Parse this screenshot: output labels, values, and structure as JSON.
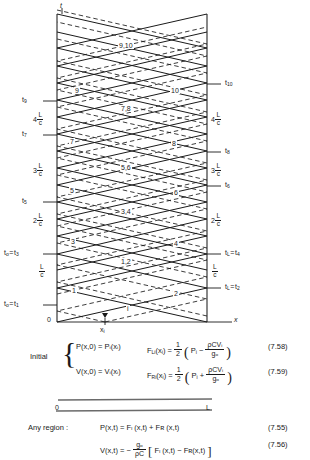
{
  "diagram": {
    "type": "x-t characteristics lattice diagram",
    "axis_t_label": "t",
    "axis_x_label": "x",
    "origin_label": "0",
    "xi_label": "x",
    "xi_sub": "i",
    "left_axis_x": 57,
    "right_axis_x": 207,
    "baseline_y": 322,
    "top_y": 14,
    "xi_x": 105,
    "left_ticks": [
      {
        "text": "t",
        "sub": "9",
        "y": 101,
        "kind": "t"
      },
      {
        "text": "4",
        "frac": [
          "L",
          "c"
        ],
        "y": 118,
        "kind": "frac"
      },
      {
        "text": "t",
        "sub": "7",
        "y": 135,
        "kind": "t"
      },
      {
        "text": "3",
        "frac": [
          "L",
          "c"
        ],
        "y": 169,
        "kind": "frac"
      },
      {
        "text": "t",
        "sub": "5",
        "y": 202,
        "kind": "t"
      },
      {
        "text": "2",
        "frac": [
          "L",
          "c"
        ],
        "y": 219,
        "kind": "frac"
      },
      {
        "text": "tₒ = t",
        "sub": "3",
        "y": 254,
        "kind": "t"
      },
      {
        "text": "",
        "frac": [
          "L",
          "c"
        ],
        "y": 270,
        "kind": "frac"
      },
      {
        "text": "tₒ = t",
        "sub": "1",
        "y": 305,
        "kind": "t"
      }
    ],
    "right_ticks": [
      {
        "text": "t",
        "sub": "10",
        "y": 84,
        "kind": "t"
      },
      {
        "text": "4",
        "frac": [
          "L",
          "c"
        ],
        "y": 118,
        "kind": "frac"
      },
      {
        "text": "t",
        "sub": "8",
        "y": 152,
        "kind": "t"
      },
      {
        "text": "3",
        "frac": [
          "L",
          "c"
        ],
        "y": 169,
        "kind": "frac"
      },
      {
        "text": "t",
        "sub": "6",
        "y": 186,
        "kind": "t"
      },
      {
        "text": "2",
        "frac": [
          "L",
          "c"
        ],
        "y": 219,
        "kind": "frac"
      },
      {
        "text": "tₗ = t",
        "sub": "4",
        "y": 254,
        "kind": "t"
      },
      {
        "text": "",
        "frac": [
          "L",
          "c"
        ],
        "y": 270,
        "kind": "frac"
      },
      {
        "text": "tₗ = t",
        "sub": "2",
        "y": 288,
        "kind": "t"
      }
    ],
    "wave_labels": [
      {
        "text": "9,10",
        "x": 124,
        "y": 47
      },
      {
        "text": "9",
        "x": 78,
        "y": 92
      },
      {
        "text": "10",
        "x": 175,
        "y": 92
      },
      {
        "text": "7,8",
        "x": 126,
        "y": 110
      },
      {
        "text": "7",
        "x": 73,
        "y": 143
      },
      {
        "text": "8",
        "x": 175,
        "y": 145
      },
      {
        "text": "5,6",
        "x": 126,
        "y": 169
      },
      {
        "text": "5",
        "x": 73,
        "y": 192
      },
      {
        "text": "6",
        "x": 177,
        "y": 194
      },
      {
        "text": "3,4",
        "x": 126,
        "y": 213
      },
      {
        "text": "3",
        "x": 74,
        "y": 243
      },
      {
        "text": "4",
        "x": 177,
        "y": 245
      },
      {
        "text": "1,2",
        "x": 126,
        "y": 263
      },
      {
        "text": "1",
        "x": 75,
        "y": 292
      },
      {
        "text": "2",
        "x": 177,
        "y": 295
      },
      {
        "text": "i",
        "x": 128,
        "y": 310
      }
    ]
  },
  "initial": {
    "label": "Initial",
    "rows": [
      {
        "left": "P(x,0) = Pᵢ(xᵢ)",
        "right_fn": "F",
        "right_sub": "Li",
        "right_arg": "(xᵢ)",
        "sign": "−",
        "term": "Pᵢ",
        "frac_num": "ρCVᵢ",
        "frac_den": "gₒ",
        "eqnum": "(7.58)"
      },
      {
        "left": "V(x,0) = Vᵢ(xᵢ)",
        "right_fn": "F",
        "right_sub": "Ri",
        "right_arg": "(xᵢ)",
        "sign": "+",
        "term": "Pᵢ",
        "frac_num": "ρCVᵢ",
        "frac_den": "gₒ",
        "eqnum": "(7.59)"
      }
    ],
    "half_num": "1",
    "half_den": "2"
  },
  "pipe": {
    "left_label": "0",
    "right_label": "L"
  },
  "any_region": {
    "label": "Any region :",
    "eq1": "P(x,t) = Fₗ (x,t) + Fʀ (x,t)",
    "eq1_num": "(7.55)",
    "eq2_lead": "V(x,t) =  −",
    "eq2_frac_num": "gₒ",
    "eq2_frac_den": "ρC",
    "eq2_body": "Fₗ (x,t) − Fʀ(x,t)",
    "eq2_num": "(7.56)"
  },
  "colors": {
    "ink": "#1a1a1a",
    "axis": "#555555",
    "background": "#ffffff"
  }
}
